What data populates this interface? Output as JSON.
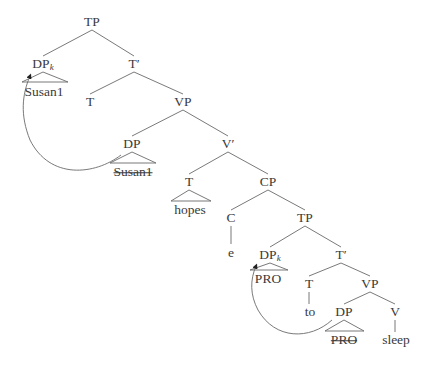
{
  "diagram": {
    "type": "syntax-tree",
    "nodes": [
      {
        "id": "tp1",
        "label": "TP",
        "x": 92,
        "y": 22
      },
      {
        "id": "dpk1",
        "label": "DP",
        "sub": "k",
        "x": 43,
        "y": 64
      },
      {
        "id": "tbar1",
        "label": "T′",
        "x": 134,
        "y": 64
      },
      {
        "id": "susan_a",
        "label": "Susan1",
        "x": 44,
        "y": 92,
        "struck": false
      },
      {
        "id": "t1",
        "label": "T",
        "x": 90,
        "y": 102
      },
      {
        "id": "vp1",
        "label": "VP",
        "x": 183,
        "y": 102
      },
      {
        "id": "dp1",
        "label": "DP",
        "x": 132,
        "y": 144
      },
      {
        "id": "vbar",
        "label": "V′",
        "x": 228,
        "y": 144
      },
      {
        "id": "susan_b",
        "label": "Susan1",
        "x": 133,
        "y": 172,
        "struck": true
      },
      {
        "id": "t2",
        "label": "T",
        "x": 189,
        "y": 182
      },
      {
        "id": "cp",
        "label": "CP",
        "x": 268,
        "y": 182
      },
      {
        "id": "hopes",
        "label": "hopes",
        "x": 190,
        "y": 210
      },
      {
        "id": "c",
        "label": "C",
        "x": 231,
        "y": 218
      },
      {
        "id": "tp2",
        "label": "TP",
        "x": 305,
        "y": 218
      },
      {
        "id": "e",
        "label": "e",
        "x": 231,
        "y": 253
      },
      {
        "id": "dpk2",
        "label": "DP",
        "sub": "k",
        "x": 270,
        "y": 255
      },
      {
        "id": "tbar2",
        "label": "T′",
        "x": 341,
        "y": 255
      },
      {
        "id": "pro_a",
        "label": "PRO",
        "x": 268,
        "y": 279,
        "struck": false
      },
      {
        "id": "t3",
        "label": "T",
        "x": 309,
        "y": 284
      },
      {
        "id": "vp2",
        "label": "VP",
        "x": 370,
        "y": 284
      },
      {
        "id": "to",
        "label": "to",
        "x": 310,
        "y": 312
      },
      {
        "id": "dp2",
        "label": "DP",
        "x": 344,
        "y": 312
      },
      {
        "id": "v",
        "label": "V",
        "x": 395,
        "y": 312
      },
      {
        "id": "pro_b",
        "label": "PRO",
        "x": 344,
        "y": 340,
        "struck": true
      },
      {
        "id": "sleep",
        "label": "sleep",
        "x": 396,
        "y": 340
      }
    ],
    "edges": [
      [
        92,
        30,
        43,
        56
      ],
      [
        92,
        30,
        134,
        56
      ],
      [
        134,
        72,
        90,
        94
      ],
      [
        134,
        72,
        183,
        94
      ],
      [
        183,
        110,
        132,
        136
      ],
      [
        183,
        110,
        228,
        136
      ],
      [
        228,
        152,
        189,
        174
      ],
      [
        228,
        152,
        268,
        174
      ],
      [
        268,
        190,
        231,
        210
      ],
      [
        268,
        190,
        305,
        210
      ],
      [
        305,
        226,
        270,
        247
      ],
      [
        305,
        226,
        341,
        247
      ],
      [
        341,
        263,
        309,
        276
      ],
      [
        341,
        263,
        370,
        276
      ],
      [
        370,
        292,
        344,
        304
      ],
      [
        370,
        292,
        395,
        304
      ],
      [
        231,
        226,
        231,
        244
      ],
      [
        309,
        292,
        309,
        304
      ],
      [
        395,
        320,
        395,
        332
      ]
    ],
    "triangles": [
      {
        "apex": [
          43,
          72
        ],
        "left": 22,
        "right": 68,
        "base": 82
      },
      {
        "apex": [
          132,
          152
        ],
        "left": 110,
        "right": 156,
        "base": 163
      },
      {
        "apex": [
          189,
          190
        ],
        "left": 171,
        "right": 211,
        "base": 201
      },
      {
        "apex": [
          270,
          263
        ],
        "left": 250,
        "right": 288,
        "base": 270
      },
      {
        "apex": [
          344,
          320
        ],
        "left": 325,
        "right": 364,
        "base": 331
      }
    ],
    "movement_arrows": [
      {
        "from": "dp1",
        "to": "dpk1",
        "path": "M 121 155 C 95 175, 50 180, 30 140 C 20 115, 22 95, 30 76"
      },
      {
        "from": "dp2",
        "to": "dpk2",
        "path": "M 332 320 C 310 340, 275 340, 258 310 C 250 295, 250 280, 256 266"
      }
    ]
  }
}
